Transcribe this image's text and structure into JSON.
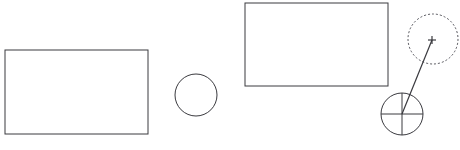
{
  "canvas": {
    "width": 460,
    "height": 150,
    "background_color": "#ffffff",
    "title": "Geometric shapes line drawing"
  },
  "style": {
    "stroke_color": "#3a3a3f",
    "stroke_color_light": "#55555c",
    "stroke_width": 1,
    "dash_pattern": "2 2",
    "fill": "none"
  },
  "shapes": [
    {
      "id": "rectangle-left",
      "name": "rectangle-left",
      "type": "rectangle",
      "x": 5,
      "y": 50,
      "width": 143,
      "height": 84,
      "stroke": "#3a3a3f",
      "stroke_width": 1,
      "fill": "none",
      "dashed": false
    },
    {
      "id": "circle-middle",
      "name": "circle-middle",
      "type": "circle",
      "cx": 196,
      "cy": 95,
      "r": 21,
      "stroke": "#3a3a3f",
      "stroke_width": 1,
      "fill": "none",
      "dashed": false
    },
    {
      "id": "rectangle-right",
      "name": "rectangle-right",
      "type": "rectangle",
      "x": 245,
      "y": 3,
      "width": 143,
      "height": 83,
      "stroke": "#3a3a3f",
      "stroke_width": 1,
      "fill": "none",
      "dashed": false
    },
    {
      "id": "crosshair-circle",
      "name": "crosshair-target-circle",
      "type": "circle",
      "cx": 402,
      "cy": 114,
      "r": 21,
      "stroke": "#3a3a3f",
      "stroke_width": 1,
      "fill": "none",
      "dashed": false
    },
    {
      "id": "dashed-circle",
      "name": "dashed-circle",
      "type": "circle",
      "cx": 433,
      "cy": 39,
      "r": 25,
      "stroke": "#55555c",
      "stroke_width": 1,
      "fill": "none",
      "dashed": true
    }
  ],
  "crosshair": {
    "name": "crosshair-lines",
    "cx": 402,
    "cy": 114,
    "r": 21,
    "horizontal": {
      "x1": 381,
      "y1": 114,
      "x2": 423,
      "y2": 114
    },
    "vertical": {
      "x1": 402,
      "y1": 93,
      "x2": 402,
      "y2": 135
    }
  },
  "leader_line": {
    "name": "leader-line",
    "x1": 402,
    "y1": 114,
    "x2": 432,
    "y2": 40,
    "stroke": "#3a3a3f",
    "stroke_width": 1.2
  },
  "plus_marker": {
    "name": "plus-marker",
    "cx": 432,
    "cy": 40,
    "arm": 4,
    "stroke": "#3a3a3f",
    "stroke_width": 1.2
  }
}
